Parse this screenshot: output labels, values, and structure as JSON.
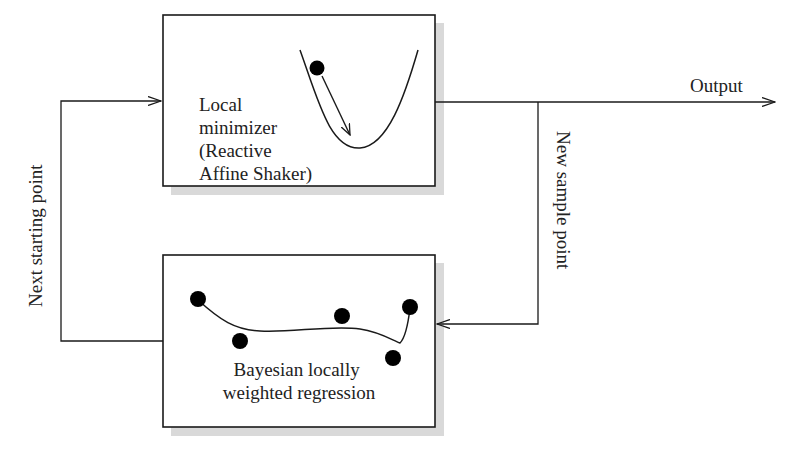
{
  "diagram": {
    "type": "flow",
    "nodes": {
      "local_minimizer": {
        "lines": [
          "Local",
          "minimizer",
          "(Reactive",
          "Affine Shaker)"
        ],
        "illustration": "parabola-with-ball-descending-arrow"
      },
      "regression": {
        "lines": [
          "Bayesian locally",
          "weighted regression"
        ],
        "illustration": "scatter-points-with-fitted-curve"
      }
    },
    "edges": {
      "output": {
        "label": "Output",
        "from": "local_minimizer",
        "to": "outside"
      },
      "new_sample": {
        "label": "New sample point",
        "from": "local_minimizer",
        "to": "regression"
      },
      "next_start": {
        "label": "Next starting point",
        "from": "regression",
        "to": "local_minimizer"
      }
    },
    "colors": {
      "line": "#1a1a1a",
      "shadow": "#d6d6d6",
      "box_fill": "#ffffff"
    }
  }
}
